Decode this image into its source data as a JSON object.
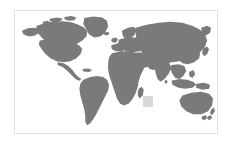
{
  "map": {
    "title": "World Map",
    "projection": "equirectangular",
    "ocean_color": "#ffffff",
    "land_color": "#7a7a7a",
    "frame_border_color": "#e2e2e2",
    "page_background_color": "#ffffff",
    "highlight": {
      "name": "indian-ocean-region-highlight",
      "color": "#d8d8d8",
      "shape": "square",
      "near_label": "Madagascar",
      "x_px": 128,
      "y_px": 85,
      "width_px": 10,
      "height_px": 11
    },
    "regions": [
      {
        "id": "north-america",
        "label": "North America"
      },
      {
        "id": "greenland",
        "label": "Greenland"
      },
      {
        "id": "central-america",
        "label": "Central America"
      },
      {
        "id": "south-america",
        "label": "South America"
      },
      {
        "id": "europe",
        "label": "Europe"
      },
      {
        "id": "africa",
        "label": "Africa"
      },
      {
        "id": "madagascar",
        "label": "Madagascar"
      },
      {
        "id": "asia",
        "label": "Asia"
      },
      {
        "id": "middle-east",
        "label": "Middle East"
      },
      {
        "id": "india",
        "label": "India"
      },
      {
        "id": "southeast-asia",
        "label": "Southeast Asia"
      },
      {
        "id": "indonesia",
        "label": "Indonesia"
      },
      {
        "id": "japan",
        "label": "Japan"
      },
      {
        "id": "australia",
        "label": "Australia"
      },
      {
        "id": "new-zealand",
        "label": "New Zealand"
      },
      {
        "id": "british-isles",
        "label": "British Isles"
      }
    ]
  }
}
